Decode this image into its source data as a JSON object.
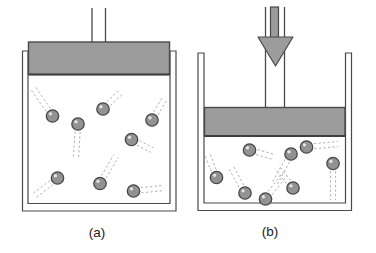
{
  "colors": {
    "background": "#ffffff",
    "outline": "#4a4a4a",
    "piston_fill": "#9c9c9c",
    "piston_stroke": "#4a4a4a",
    "piston_edge": "#3f3f3f",
    "particle_fill": "#929292",
    "particle_stroke": "#474747",
    "particle_highlight": "#e9e9e9",
    "trail": "#b2b0ac",
    "arrow_fill": "#9c9c9c",
    "arrow_stroke": "#4a4a4a",
    "label_color": "#1a1a1a"
  },
  "panels": [
    {
      "name": "a",
      "label": "(a)",
      "cup": {
        "outer_left": 22.5,
        "inner_left": 28,
        "inner_right": 170,
        "outer_right": 176,
        "top": 51,
        "inner_bottom": 203.5,
        "outer_bottom": 211
      },
      "piston": {
        "x1": 28.5,
        "y1": 42,
        "x2": 169.5,
        "y2": 74.5
      },
      "rod": {
        "left_x": 92,
        "right_x": 105.5,
        "top_y": 8
      },
      "force_arrow": null,
      "particles": [
        {
          "cx": 52.5,
          "cy": 116,
          "tx": 33,
          "ty": 88
        },
        {
          "cx": 78,
          "cy": 124,
          "tx": 76,
          "ty": 157
        },
        {
          "cx": 103,
          "cy": 109,
          "tx": 121,
          "ty": 92
        },
        {
          "cx": 152,
          "cy": 120,
          "tx": 165,
          "ty": 98
        },
        {
          "cx": 131.5,
          "cy": 139.5,
          "tx": 152,
          "ty": 150
        },
        {
          "cx": 57.5,
          "cy": 178,
          "tx": 34,
          "ty": 196
        },
        {
          "cx": 100,
          "cy": 183.5,
          "tx": 116,
          "ty": 156
        },
        {
          "cx": 133.5,
          "cy": 191,
          "tx": 164,
          "ty": 188
        }
      ]
    },
    {
      "name": "b",
      "label": "(b)",
      "cup": {
        "outer_left": 198,
        "inner_left": 204,
        "inner_right": 345.5,
        "outer_right": 351.5,
        "top": 53,
        "inner_bottom": 203,
        "outer_bottom": 210.5
      },
      "piston": {
        "x1": 204.5,
        "y1": 107.5,
        "x2": 345,
        "y2": 136
      },
      "rod": {
        "left_x": 265.5,
        "right_x": 284.5,
        "top_y": 7
      },
      "force_arrow": {
        "shaft_x1": 270.5,
        "shaft_x2": 278.5,
        "shaft_top": 7,
        "head_top": 37,
        "head_left": 258,
        "head_right": 293,
        "tip_x": 275.5,
        "tip_y": 66
      },
      "particles": [
        {
          "cx": 216.5,
          "cy": 177.5,
          "tx": 207,
          "ty": 153
        },
        {
          "cx": 245,
          "cy": 193,
          "tx": 231,
          "ty": 167
        },
        {
          "cx": 249.5,
          "cy": 150,
          "tx": 274,
          "ty": 157
        },
        {
          "cx": 265.5,
          "cy": 199,
          "tx": 285,
          "ty": 174
        },
        {
          "cx": 291,
          "cy": 154,
          "tx": 275,
          "ty": 183
        },
        {
          "cx": 293,
          "cy": 188,
          "tx": 277,
          "ty": 167
        },
        {
          "cx": 306.5,
          "cy": 147,
          "tx": 338,
          "ty": 144
        },
        {
          "cx": 333,
          "cy": 163.5,
          "tx": 333,
          "ty": 200
        }
      ]
    }
  ]
}
